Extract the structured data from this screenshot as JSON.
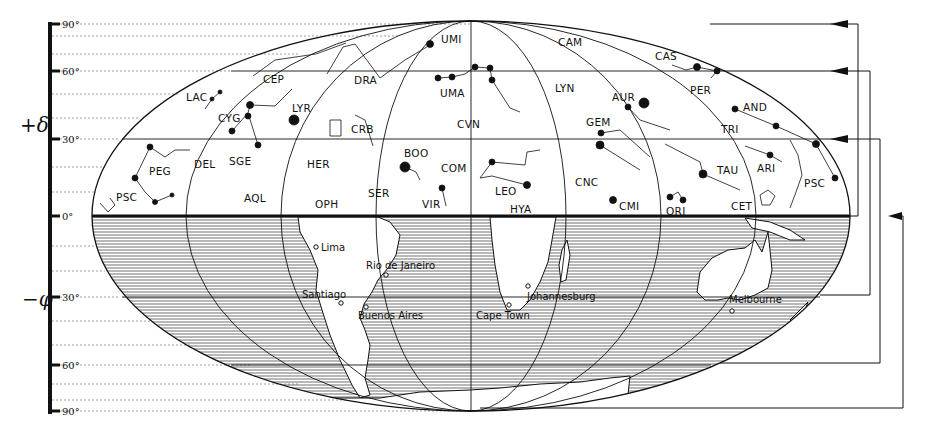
{
  "diagram": {
    "type": "star-map-projection",
    "axis": {
      "upper_symbol": "+δ",
      "lower_symbol": "−φ",
      "ticks": [
        {
          "label": "90°",
          "y": 24
        },
        {
          "label": "60°",
          "y": 71
        },
        {
          "label": "30°",
          "y": 139
        },
        {
          "label": "0°",
          "y": 216
        },
        {
          "label": "30°",
          "y": 297
        },
        {
          "label": "60°",
          "y": 365
        },
        {
          "label": "90°",
          "y": 411
        }
      ]
    },
    "constellations": [
      {
        "label": "UMI",
        "x": 441,
        "y": 43
      },
      {
        "label": "CAM",
        "x": 558,
        "y": 46
      },
      {
        "label": "CAS",
        "x": 655,
        "y": 60
      },
      {
        "label": "CEP",
        "x": 263,
        "y": 83
      },
      {
        "label": "DRA",
        "x": 354,
        "y": 84
      },
      {
        "label": "UMA",
        "x": 440,
        "y": 97
      },
      {
        "label": "LYN",
        "x": 555,
        "y": 92
      },
      {
        "label": "PER",
        "x": 690,
        "y": 94
      },
      {
        "label": "LAC",
        "x": 186,
        "y": 101
      },
      {
        "label": "AUR",
        "x": 612,
        "y": 101
      },
      {
        "label": "AND",
        "x": 743,
        "y": 111
      },
      {
        "label": "LYR",
        "x": 292,
        "y": 112
      },
      {
        "label": "CYG",
        "x": 218,
        "y": 122
      },
      {
        "label": "CVN",
        "x": 457,
        "y": 128
      },
      {
        "label": "CRB",
        "x": 351,
        "y": 133
      },
      {
        "label": "GEM",
        "x": 586,
        "y": 126
      },
      {
        "label": "TRI",
        "x": 721,
        "y": 133
      },
      {
        "label": "BOO",
        "x": 404,
        "y": 157
      },
      {
        "label": "DEL",
        "x": 194,
        "y": 168
      },
      {
        "label": "SGE",
        "x": 229,
        "y": 165
      },
      {
        "label": "HER",
        "x": 307,
        "y": 168
      },
      {
        "label": "COM",
        "x": 441,
        "y": 172
      },
      {
        "label": "TAU",
        "x": 717,
        "y": 174
      },
      {
        "label": "ARI",
        "x": 757,
        "y": 172
      },
      {
        "label": "PEG",
        "x": 149,
        "y": 175
      },
      {
        "label": "CNC",
        "x": 575,
        "y": 186
      },
      {
        "label": "LEO",
        "x": 495,
        "y": 195
      },
      {
        "label": "PSC",
        "x": 116,
        "y": 201
      },
      {
        "label": "AQL",
        "x": 244,
        "y": 202
      },
      {
        "label": "SER",
        "x": 368,
        "y": 197
      },
      {
        "label": "PSC",
        "x": 804,
        "y": 187
      },
      {
        "label": "OPH",
        "x": 315,
        "y": 208
      },
      {
        "label": "VIR",
        "x": 422,
        "y": 208
      },
      {
        "label": "HYA",
        "x": 510,
        "y": 213
      },
      {
        "label": "CMI",
        "x": 619,
        "y": 210
      },
      {
        "label": "ORI",
        "x": 666,
        "y": 215
      },
      {
        "label": "CET",
        "x": 731,
        "y": 210
      }
    ],
    "cities": [
      {
        "label": "Lima",
        "x": 321,
        "y": 249
      },
      {
        "label": "Rio de Janeiro",
        "x": 366,
        "y": 267
      },
      {
        "label": "Santiago",
        "x": 302,
        "y": 297
      },
      {
        "label": "Buenos Aires",
        "x": 358,
        "y": 317
      },
      {
        "label": "Johannesburg",
        "x": 527,
        "y": 299
      },
      {
        "label": "Cape Town",
        "x": 476,
        "y": 318
      },
      {
        "label": "Melbourne",
        "x": 729,
        "y": 302
      }
    ],
    "arrows": [
      {
        "from": "+90°",
        "to": "0°"
      },
      {
        "from": "+60°",
        "to": "−30°"
      },
      {
        "from": "+30°",
        "to": "−60°"
      },
      {
        "from": "0°",
        "to": "−90°"
      }
    ],
    "colors": {
      "ink": "#111111",
      "background": "#ffffff",
      "grid": "#888888"
    }
  }
}
